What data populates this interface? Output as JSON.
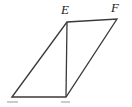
{
  "figure": {
    "kind": "geometry-diagram",
    "shape": "parallelogram-with-diagonal",
    "background_color": "#ffffff",
    "stroke_color": "#3a3a3a",
    "stroke_width": 1.3,
    "canvas": {
      "width": 132,
      "height": 107
    },
    "labels": {
      "top_left_vertex": "E",
      "top_right_vertex": "F"
    },
    "vertices": {
      "bottom_left": {
        "x": 12,
        "y": 97
      },
      "top_left": {
        "x": 67,
        "y": 22
      },
      "top_right": {
        "x": 117,
        "y": 19
      },
      "bottom_right": {
        "x": 66,
        "y": 97
      }
    },
    "edges": [
      {
        "name": "bottom-edge",
        "from": "bottom_left",
        "to": "bottom_right"
      },
      {
        "name": "left-edge",
        "from": "bottom_left",
        "to": "top_left"
      },
      {
        "name": "top-edge",
        "from": "top_left",
        "to": "top_right"
      },
      {
        "name": "right-edge",
        "from": "top_right",
        "to": "bottom_right"
      },
      {
        "name": "diagonal-edge",
        "from": "top_left",
        "to": "bottom_right"
      }
    ],
    "notes": {
      "bottom_labels": "cut off at image edge, illegible"
    }
  }
}
